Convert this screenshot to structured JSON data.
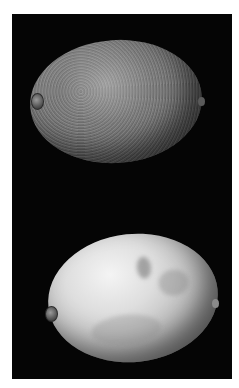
{
  "image": {
    "description": "Grayscale photograph of two citrus fruits (lemons) on a black background",
    "colors": {
      "border": "#ffffff",
      "background": "#050505",
      "top_fruit": "#6f6f6f",
      "bottom_fruit": "#dedede"
    },
    "subjects": [
      {
        "name": "top-lemon",
        "appearance": "textured, pitted, mid-gray skin"
      },
      {
        "name": "bottom-lemon",
        "appearance": "smooth, pale skin with mottled blemishes"
      }
    ]
  }
}
